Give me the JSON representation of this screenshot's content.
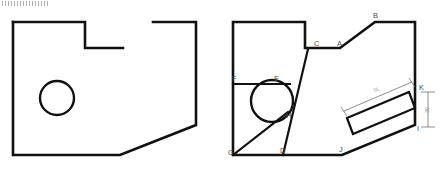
{
  "figure": {
    "stroke_color": "#111111",
    "dimension_color": "#6e6e6e",
    "label_color": "#4a4a4a",
    "background_color": "#ffffff"
  },
  "left_view": {
    "name": "unlabeled-plate-outline",
    "outline_points": "13,22 85,22 85,48 123,48",
    "outline_points_2": "153,22 196,22 196,125 120,155 13,155 13,22",
    "hole": {
      "cx": 57,
      "cy": 98,
      "r": 17
    }
  },
  "right_view": {
    "name": "labeled-plate-outline",
    "outline_points": "233,22 305,22 305,48 340,48 375,22 415,22 415,125 342,155 233,155 233,22",
    "hole": {
      "cx": 272,
      "cy": 101,
      "r": 21
    },
    "internal_lines": [
      {
        "name": "line-C-D",
        "points": "308,49 283,155"
      },
      {
        "name": "line-F-E",
        "points": "233,84 290,84"
      },
      {
        "name": "line-G-H",
        "points": "233,155 288,112"
      }
    ],
    "inset_rect": {
      "name": "rotated-slot",
      "points": "347,118 409,92 415,108 353,134"
    },
    "vertices": [
      {
        "id": "A",
        "x": 340,
        "y": 48,
        "label_x": 337,
        "label_y": 46
      },
      {
        "id": "B",
        "x": 375,
        "y": 22,
        "label_x": 373,
        "label_y": 18
      },
      {
        "id": "C",
        "x": 308,
        "y": 48,
        "label_x": 314,
        "label_y": 46
      },
      {
        "id": "D",
        "x": 283,
        "y": 155,
        "label_x": 280,
        "label_y": 153
      },
      {
        "id": "E",
        "x": 277,
        "y": 84,
        "label_x": 274,
        "label_y": 81
      },
      {
        "id": "F",
        "x": 234,
        "y": 84,
        "label_x": 232,
        "label_y": 81
      },
      {
        "id": "G",
        "x": 233,
        "y": 155,
        "label_x": 228,
        "label_y": 155
      },
      {
        "id": "H",
        "x": 288,
        "y": 113,
        "label_x": 286,
        "label_y": 118
      },
      {
        "id": "I",
        "x": 415,
        "y": 125,
        "label_x": 417,
        "label_y": 131
      },
      {
        "id": "J",
        "x": 342,
        "y": 155,
        "label_x": 339,
        "label_y": 152
      },
      {
        "id": "K",
        "x": 415,
        "y": 92,
        "label_x": 419,
        "label_y": 90
      }
    ],
    "dimensions": [
      {
        "id": "slot-length",
        "label": "SL",
        "label_x": 377,
        "label_y": 91,
        "label_rotation": -23,
        "line": "344,111 412,82",
        "tick_a": "341,107 347,116",
        "tick_b": "409,78 415,87"
      },
      {
        "id": "edge-height",
        "label": "30",
        "label_x": 429,
        "label_y": 110,
        "label_rotation": -90,
        "line": "428,92 428,127",
        "tick_a": "421,92 435,92",
        "tick_b": "421,127 435,127"
      }
    ]
  }
}
